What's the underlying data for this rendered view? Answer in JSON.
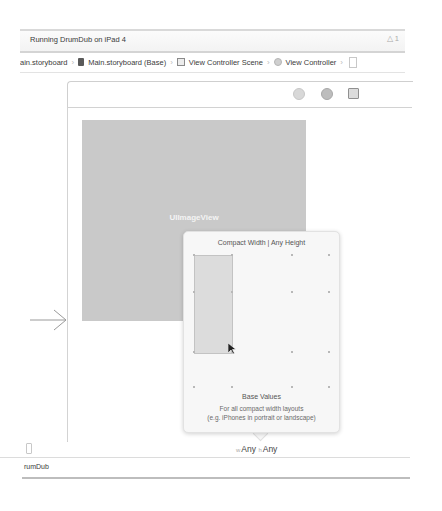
{
  "status_bar": {
    "text": "Running DrumDub on iPad 4",
    "warning_icon": "warning-triangle-icon",
    "warning_count": "1"
  },
  "breadcrumb": {
    "items": [
      {
        "label": "Main.storyboard",
        "icon": "",
        "display": "ain.storyboard"
      },
      {
        "label": "Main.storyboard (Base)",
        "icon": "storyboard-file-icon"
      },
      {
        "label": "View Controller Scene",
        "icon": "scene-icon"
      },
      {
        "label": "View Controller",
        "icon": "view-controller-icon"
      }
    ]
  },
  "scene_dock": {
    "icons": [
      "view-controller-dock-icon",
      "first-responder-dock-icon",
      "exit-dock-icon"
    ]
  },
  "canvas": {
    "image_view_label": "UIImageView",
    "entry_point_icon": "entry-arrow-icon"
  },
  "size_class_popover": {
    "title": "Compact Width | Any Height",
    "base_title": "Base Values",
    "base_desc_line1": "For all compact width layouts",
    "base_desc_line2": "(e.g. iPhones in portrait or landscape)"
  },
  "size_class_bar": {
    "width_prefix": "w",
    "width_value": "Any",
    "height_prefix": "h",
    "height_value": "Any"
  },
  "debug_bar": {
    "text": "DrumDub",
    "display": "rumDub"
  }
}
